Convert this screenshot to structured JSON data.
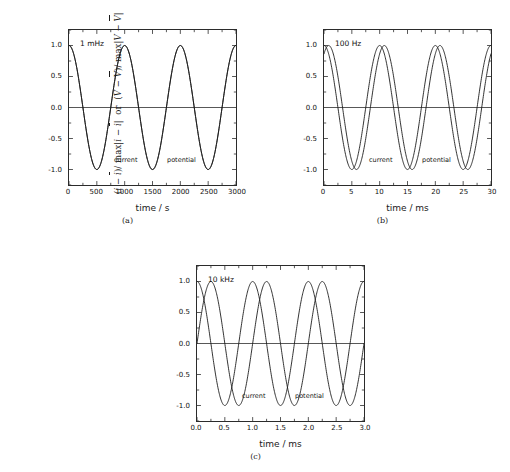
{
  "figure": {
    "background": "#ffffff",
    "curve_color": "#1a1a1a",
    "axis_color": "#2b2b2b"
  },
  "axis_label": {
    "y_part1_open": "(",
    "y_i": "i",
    "y_minus1": " − ",
    "y_ibar": "i",
    "y_part1_close": ")/ max",
    "y_abs1_open": "|",
    "y_i2": "i",
    "y_minus2": " − ",
    "y_ibar2": "i",
    "y_abs1_close": "|",
    "y_or": "or",
    "y_part2_open": "(",
    "y_V": "V",
    "y_minus3": " − ",
    "y_Vbar": "V",
    "y_part2_close": ")/ max",
    "y_abs2_open": "|",
    "y_V2": "V",
    "y_minus4": " − ",
    "y_Vbar2": "V",
    "y_abs2_close": "|"
  },
  "common": {
    "y_ticks": [
      "1.0",
      "0.5",
      "0.0",
      "-0.5",
      "-1.0"
    ],
    "y_tick_values": [
      1.0,
      0.5,
      0.0,
      -0.5,
      -1.0
    ],
    "ylim": [
      -1.25,
      1.25
    ],
    "label_current": "current",
    "label_potential": "potential"
  },
  "chart_data": [
    {
      "id": "a",
      "type": "line",
      "caption": "(a)",
      "annotation": "1 mHz",
      "frequency_hz": 0.001,
      "xlabel": "time / s",
      "ylabel": "(i − ī)/ max|i − ī|  or  (V − V̄)/ max|V − V̄|",
      "xlim": [
        0,
        3000
      ],
      "ylim": [
        -1.25,
        1.25
      ],
      "x_ticks": [
        "0",
        "500",
        "1000",
        "1500",
        "2000",
        "2500",
        "3000"
      ],
      "x_tick_values": [
        0,
        500,
        1000,
        1500,
        2000,
        2500,
        3000
      ],
      "y_ticks": [
        "1.0",
        "0.5",
        "0.0",
        "-0.5",
        "-1.0"
      ],
      "grid": false,
      "legend": "in-plot text labels",
      "cycles": 3,
      "period": 1000,
      "phase_shift_deg": 0,
      "series": [
        {
          "name": "current",
          "formula": "cos(2*pi*t/1000)",
          "amplitude": 1.0,
          "period": 1000,
          "phase_deg": 0
        },
        {
          "name": "potential",
          "formula": "cos(2*pi*t/1000)",
          "amplitude": 1.0,
          "period": 1000,
          "phase_deg": 0
        }
      ]
    },
    {
      "id": "b",
      "type": "line",
      "caption": "(b)",
      "annotation": "100 Hz",
      "frequency_hz": 100,
      "xlabel": "time / ms",
      "ylabel": "(i − ī)/ max|i − ī|  or  (V − V̄)/ max|V − V̄|",
      "xlim": [
        0,
        30
      ],
      "ylim": [
        -1.25,
        1.25
      ],
      "x_ticks": [
        "0",
        "5",
        "10",
        "15",
        "20",
        "25",
        "30"
      ],
      "x_tick_values": [
        0,
        5,
        10,
        15,
        20,
        25,
        30
      ],
      "y_ticks": [
        "1.0",
        "0.5",
        "0.0",
        "-0.5",
        "-1.0"
      ],
      "grid": false,
      "legend": "in-plot text labels",
      "cycles": 3,
      "period": 10,
      "phase_shift_deg": 30,
      "series": [
        {
          "name": "current",
          "formula": "cos(2*pi*t/10)",
          "amplitude": 1.0,
          "period": 10,
          "phase_deg": 0
        },
        {
          "name": "potential",
          "formula": "cos(2*pi*t/10 - 30deg)",
          "amplitude": 1.0,
          "period": 10,
          "phase_deg": -30
        }
      ]
    },
    {
      "id": "c",
      "type": "line",
      "caption": "(c)",
      "annotation": "10 kHz",
      "frequency_hz": 10000,
      "xlabel": "time / ms",
      "ylabel": "(i − ī)/ max|i − ī|  or  (V − V̄)/ max|V − V̄|",
      "xlim": [
        0,
        3
      ],
      "ylim": [
        -1.25,
        1.25
      ],
      "x_ticks": [
        "0.0",
        "0.5",
        "1.0",
        "1.5",
        "2.0",
        "2.5",
        "3.0"
      ],
      "x_tick_values": [
        0,
        0.5,
        1.0,
        1.5,
        2.0,
        2.5,
        3.0
      ],
      "y_ticks": [
        "1.0",
        "0.5",
        "0.0",
        "-0.5",
        "-1.0"
      ],
      "grid": false,
      "legend": "in-plot text labels",
      "cycles": 3,
      "period": 1,
      "phase_shift_deg": 90,
      "series": [
        {
          "name": "current",
          "formula": "cos(2*pi*t/1)",
          "amplitude": 1.0,
          "period": 1,
          "phase_deg": 0
        },
        {
          "name": "potential",
          "formula": "cos(2*pi*t/1 - 90deg)",
          "amplitude": 1.0,
          "period": 1,
          "phase_deg": -90
        }
      ]
    }
  ]
}
